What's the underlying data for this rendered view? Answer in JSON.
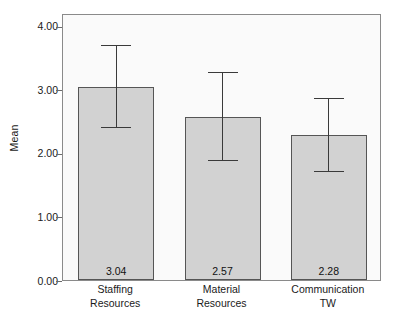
{
  "chart_data": {
    "type": "bar",
    "title": "",
    "xlabel": "",
    "ylabel": "Mean",
    "categories": [
      "Staffing Resources",
      "Material Resources",
      "Communication TW"
    ],
    "category_lines": [
      [
        "Staffing",
        "Resources"
      ],
      [
        "Material",
        "Resources"
      ],
      [
        "Communication",
        "TW"
      ]
    ],
    "values": [
      3.04,
      2.57,
      2.28
    ],
    "value_labels": [
      "3.04",
      "2.57",
      "2.28"
    ],
    "error_bars": [
      {
        "lower": 2.39,
        "upper": 3.68
      },
      {
        "lower": 1.88,
        "upper": 3.26
      },
      {
        "lower": 1.7,
        "upper": 2.85
      }
    ],
    "ylim": [
      0.0,
      4.2
    ],
    "yticks": [
      0.0,
      1.0,
      2.0,
      3.0,
      4.0
    ],
    "ytick_labels": [
      "0.00",
      "1.00",
      "2.00",
      "3.00",
      "4.00"
    ],
    "grid": false,
    "legend": null,
    "bar_fill_color": "#d2d2d2",
    "bar_border_color": "#555555",
    "error_bar_color": "#3a3a3a",
    "plot_background": "#fafafa",
    "frame_color": "#8a8a8a"
  },
  "caption": {
    "label": "",
    "text": ""
  }
}
